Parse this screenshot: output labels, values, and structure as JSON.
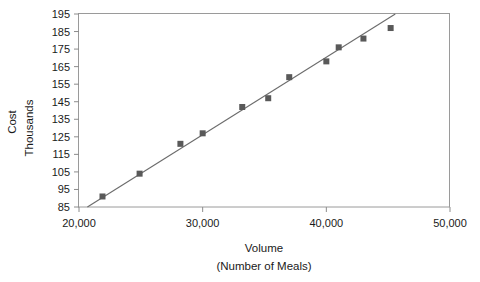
{
  "chart_data": {
    "type": "scatter",
    "title": "",
    "subtitle": "",
    "xlabel": "Volume",
    "xlabel_line2": "(Number of Meals)",
    "ylabel": "Cost",
    "ylabel_line2": "Thousands",
    "xlim": [
      20000,
      50000
    ],
    "ylim": [
      85,
      195
    ],
    "grid": false,
    "legend": null,
    "x_ticks": [
      20000,
      30000,
      40000,
      50000
    ],
    "x_tick_labels": [
      "20,000",
      "30,000",
      "40,000",
      "50,000"
    ],
    "y_ticks": [
      85,
      95,
      105,
      115,
      125,
      135,
      145,
      155,
      165,
      175,
      185,
      195
    ],
    "y_tick_labels": [
      "85",
      "95",
      "105",
      "115",
      "125",
      "135",
      "145",
      "155",
      "165",
      "175",
      "185",
      "195"
    ],
    "marker": "square",
    "marker_color": "#595959",
    "line_color": "#6b6b6b",
    "frame_color": "#9a9a9a",
    "series": [
      {
        "name": "Cost observations",
        "points": [
          {
            "x": 21900,
            "y": 91
          },
          {
            "x": 24900,
            "y": 104
          },
          {
            "x": 28200,
            "y": 121
          },
          {
            "x": 30000,
            "y": 127
          },
          {
            "x": 33200,
            "y": 142
          },
          {
            "x": 35300,
            "y": 147
          },
          {
            "x": 37000,
            "y": 159
          },
          {
            "x": 40000,
            "y": 168
          },
          {
            "x": 41000,
            "y": 176
          },
          {
            "x": 43000,
            "y": 181
          },
          {
            "x": 45200,
            "y": 187
          }
        ]
      }
    ],
    "trendline": {
      "name": "Fitted regression line",
      "x_start": 20000,
      "y_start": 82,
      "x_end": 45800,
      "y_end": 196
    }
  }
}
